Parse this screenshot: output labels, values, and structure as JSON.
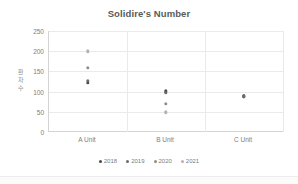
{
  "chart_data": {
    "type": "scatter",
    "title": "Solidire's Number",
    "xlabel": "",
    "ylabel": "환자수",
    "categories": [
      "A Unit",
      "B Unit",
      "C Unit"
    ],
    "ylim": [
      0,
      250
    ],
    "yticks": [
      0,
      50,
      100,
      150,
      200,
      250
    ],
    "grid": true,
    "legend_position": "bottom",
    "series": [
      {
        "name": "2018",
        "color": "#4a4a4a",
        "points": [
          {
            "category": "A Unit",
            "value": 122
          },
          {
            "category": "B Unit",
            "value": 101
          },
          {
            "category": "C Unit",
            "value": 88
          }
        ]
      },
      {
        "name": "2019",
        "color": "#6b6b6b",
        "points": [
          {
            "category": "A Unit",
            "value": 127
          },
          {
            "category": "B Unit",
            "value": 97
          },
          {
            "category": "C Unit",
            "value": 88
          }
        ]
      },
      {
        "name": "2020",
        "color": "#8c8c8c",
        "points": [
          {
            "category": "A Unit",
            "value": 159
          },
          {
            "category": "B Unit",
            "value": 70
          }
        ]
      },
      {
        "name": "2021",
        "color": "#b3b3b3",
        "points": [
          {
            "category": "A Unit",
            "value": 200
          },
          {
            "category": "B Unit",
            "value": 49
          }
        ]
      }
    ]
  },
  "legend": {
    "items": [
      {
        "label": "2018"
      },
      {
        "label": "2019"
      },
      {
        "label": "2020"
      },
      {
        "label": "2021"
      }
    ]
  },
  "colors": {
    "grid": "#eaeaea",
    "axis": "#d4d4d4",
    "text": "#7d7d7d",
    "title": "#5a5a5a",
    "background": "#ffffff"
  }
}
